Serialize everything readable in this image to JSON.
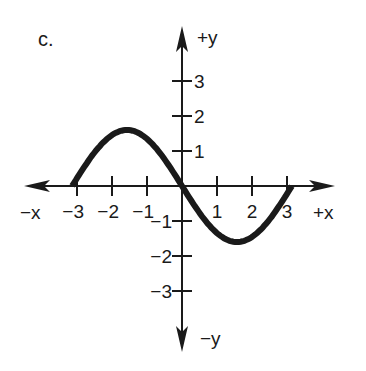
{
  "panel_label": "c.",
  "chart_data": {
    "type": "line",
    "title": "",
    "function_description": "Sine-shaped curve starting near (-3.14, 0), peaking near (-1.57, 1.6), crossing the origin, dipping to about (1.57, -1.6), ending near (3.14, 0)",
    "xlabel_positive": "+x",
    "xlabel_negative": "−x",
    "ylabel_positive": "+y",
    "ylabel_negative": "−y",
    "x_ticks": [
      -3,
      -2,
      -1,
      1,
      2,
      3
    ],
    "x_tick_labels": [
      "−3",
      "−2",
      "−1",
      "1",
      "2",
      "3"
    ],
    "y_ticks": [
      3,
      2,
      1,
      -1,
      -2,
      -3
    ],
    "y_tick_labels": [
      "3",
      "2",
      "1",
      "−1",
      "−2",
      "−3"
    ],
    "xlim": [
      -4.5,
      4.5
    ],
    "ylim": [
      -4.6,
      4.6
    ],
    "grid": false,
    "legend": null,
    "series": [
      {
        "name": "curve",
        "x": [
          -3.14,
          -2.75,
          -2.36,
          -1.96,
          -1.57,
          -1.18,
          -0.79,
          -0.39,
          0,
          0.39,
          0.79,
          1.18,
          1.57,
          1.96,
          2.36,
          2.75,
          3.14
        ],
        "y": [
          0,
          0.61,
          1.13,
          1.48,
          1.6,
          1.48,
          1.13,
          0.61,
          0,
          -0.61,
          -1.13,
          -1.48,
          -1.6,
          -1.48,
          -1.13,
          -0.61,
          0
        ]
      }
    ]
  },
  "layout": {
    "origin_px": [
      182,
      186
    ],
    "unit_px": 35,
    "x_axis_px": [
      24,
      335
    ],
    "y_axis_px": [
      26,
      352
    ],
    "curve_color": "#1a1a1a",
    "axis_color": "#1a1a1a"
  }
}
